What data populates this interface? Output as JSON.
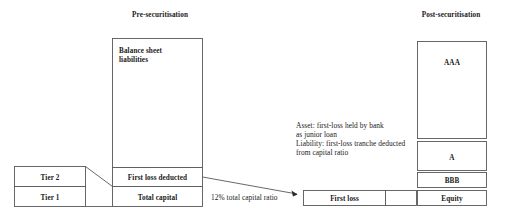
{
  "diagram": {
    "background_color": "#ffffff",
    "line_color": "#55585c",
    "text_color": "#1a1a1a",
    "titles": {
      "left": "Pre-securitisation",
      "right": "Post-securitisation"
    },
    "left_panel": {
      "balance_sheet_box": {
        "label_line1": "Balance sheet",
        "label_line2": "liabilities"
      },
      "first_loss_deducted": "First loss deducted",
      "total_capital": "Total capital",
      "tier2": "Tier 2",
      "tier1": "Tier 1"
    },
    "center_note": {
      "line1": "Asset: first-loss held by bank",
      "line2": "as junior loan",
      "line3": "Liability: first-loss tranche deducted",
      "line4": "from capital ratio"
    },
    "capital_ratio_caption": "12% total capital ratio",
    "bottom_bar": {
      "first_loss": "First loss",
      "gap_box": ""
    },
    "right_panel": {
      "tranches": [
        {
          "label": "AAA"
        },
        {
          "label": "A"
        },
        {
          "label": "BBB"
        },
        {
          "label": "Equity"
        }
      ]
    }
  }
}
